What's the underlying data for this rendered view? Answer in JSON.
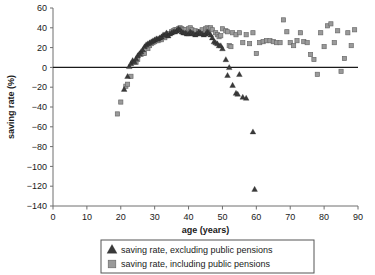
{
  "chart_data": {
    "type": "scatter",
    "title": "",
    "xlabel": "age (years)",
    "ylabel": "saving rate (%)",
    "xlim": [
      0,
      90
    ],
    "ylim": [
      -140,
      60
    ],
    "xticks": [
      0,
      10,
      20,
      30,
      40,
      50,
      60,
      70,
      80,
      90
    ],
    "yticks": [
      60,
      40,
      20,
      0,
      -20,
      -40,
      -60,
      -80,
      -100,
      -120,
      -140
    ],
    "grid": false,
    "zero_line": true,
    "legend_position": "bottom",
    "series": [
      {
        "name": "saving rate, excluding public pensions",
        "marker": "triangle",
        "color": "#3a3a3a",
        "points": [
          [
            21,
            -22
          ],
          [
            22,
            -9
          ],
          [
            22.5,
            1
          ],
          [
            23,
            4
          ],
          [
            23.5,
            7
          ],
          [
            24,
            6
          ],
          [
            24.5,
            9
          ],
          [
            25,
            12
          ],
          [
            25.5,
            14
          ],
          [
            26,
            16
          ],
          [
            26.5,
            18
          ],
          [
            27,
            21
          ],
          [
            27.5,
            23
          ],
          [
            28,
            24
          ],
          [
            28.5,
            25
          ],
          [
            29,
            26
          ],
          [
            29.5,
            27
          ],
          [
            30,
            28
          ],
          [
            30.5,
            29
          ],
          [
            31,
            29
          ],
          [
            31.5,
            30
          ],
          [
            32,
            31
          ],
          [
            32.5,
            33
          ],
          [
            33,
            33
          ],
          [
            33.5,
            35
          ],
          [
            34,
            32
          ],
          [
            34.5,
            34
          ],
          [
            35,
            35
          ],
          [
            35.5,
            36
          ],
          [
            36,
            36
          ],
          [
            36.5,
            37
          ],
          [
            37,
            39
          ],
          [
            37.5,
            38
          ],
          [
            38,
            36
          ],
          [
            38.5,
            35
          ],
          [
            39,
            35
          ],
          [
            39.5,
            34
          ],
          [
            40,
            34
          ],
          [
            40.5,
            36
          ],
          [
            41,
            35
          ],
          [
            41.5,
            34
          ],
          [
            42,
            33
          ],
          [
            42.5,
            34
          ],
          [
            43,
            36
          ],
          [
            43.5,
            35
          ],
          [
            44,
            34
          ],
          [
            44.5,
            33
          ],
          [
            45,
            34
          ],
          [
            45.5,
            36
          ],
          [
            46,
            35
          ],
          [
            46.5,
            33
          ],
          [
            47,
            30
          ],
          [
            47.5,
            26
          ],
          [
            48,
            25
          ],
          [
            48.5,
            24
          ],
          [
            49,
            22
          ],
          [
            49.5,
            22
          ],
          [
            50,
            19
          ],
          [
            51,
            8
          ],
          [
            52,
            0
          ],
          [
            51.5,
            -8
          ],
          [
            53,
            -18
          ],
          [
            54,
            -26
          ],
          [
            54.5,
            -27
          ],
          [
            55,
            -7
          ],
          [
            56,
            -30
          ],
          [
            57,
            -31
          ],
          [
            59,
            -65
          ],
          [
            59.5,
            -123
          ]
        ]
      },
      {
        "name": "saving rate, including public pensions",
        "marker": "square",
        "color": "#9a9a9a",
        "points": [
          [
            19,
            -47
          ],
          [
            20,
            -35
          ],
          [
            21.5,
            -19
          ],
          [
            22,
            -17
          ],
          [
            23,
            -9
          ],
          [
            24,
            5
          ],
          [
            24.5,
            5
          ],
          [
            25,
            8
          ],
          [
            26,
            13
          ],
          [
            26.5,
            14
          ],
          [
            27,
            14
          ],
          [
            28,
            19
          ],
          [
            28.5,
            22
          ],
          [
            29,
            24
          ],
          [
            29.5,
            25
          ],
          [
            30,
            26
          ],
          [
            30.5,
            27
          ],
          [
            31,
            27
          ],
          [
            31.5,
            28
          ],
          [
            32,
            28
          ],
          [
            33,
            30
          ],
          [
            33.5,
            32
          ],
          [
            34,
            34
          ],
          [
            35,
            36
          ],
          [
            35.5,
            37
          ],
          [
            36,
            38
          ],
          [
            36.5,
            38
          ],
          [
            37,
            39
          ],
          [
            37.5,
            40
          ],
          [
            38,
            39
          ],
          [
            38.5,
            38
          ],
          [
            39,
            38
          ],
          [
            40,
            39
          ],
          [
            40.5,
            40
          ],
          [
            41,
            38
          ],
          [
            42,
            37
          ],
          [
            43,
            36
          ],
          [
            44,
            38
          ],
          [
            45,
            39
          ],
          [
            45.5,
            40
          ],
          [
            46,
            39
          ],
          [
            46.5,
            40
          ],
          [
            47,
            38
          ],
          [
            48,
            35
          ],
          [
            48.5,
            33
          ],
          [
            49,
            31
          ],
          [
            49.5,
            32
          ],
          [
            50,
            39
          ],
          [
            51,
            37
          ],
          [
            51.5,
            36
          ],
          [
            52,
            22
          ],
          [
            52.5,
            21
          ],
          [
            53,
            35
          ],
          [
            54,
            33
          ],
          [
            55,
            35
          ],
          [
            56,
            25
          ],
          [
            57,
            33
          ],
          [
            58,
            24
          ],
          [
            59,
            35
          ],
          [
            60,
            14
          ],
          [
            61,
            25
          ],
          [
            62,
            26
          ],
          [
            63,
            27
          ],
          [
            64,
            27
          ],
          [
            65,
            26
          ],
          [
            66,
            25
          ],
          [
            67,
            25
          ],
          [
            68,
            48
          ],
          [
            69,
            36
          ],
          [
            70,
            25
          ],
          [
            71,
            22
          ],
          [
            72,
            27
          ],
          [
            73,
            35
          ],
          [
            74,
            26
          ],
          [
            75,
            25
          ],
          [
            76,
            13
          ],
          [
            77,
            8
          ],
          [
            78,
            -7
          ],
          [
            79,
            35
          ],
          [
            80,
            21
          ],
          [
            81,
            42
          ],
          [
            82,
            44
          ],
          [
            83,
            25
          ],
          [
            84,
            37
          ],
          [
            85,
            -4
          ],
          [
            86,
            9
          ],
          [
            87,
            35
          ],
          [
            88,
            22
          ],
          [
            89,
            38
          ]
        ]
      }
    ],
    "legend": [
      {
        "label": "saving rate, excluding public pensions",
        "marker": "triangle",
        "color": "#3a3a3a"
      },
      {
        "label": "saving rate, including public pensions",
        "marker": "square",
        "color": "#9a9a9a"
      }
    ]
  }
}
